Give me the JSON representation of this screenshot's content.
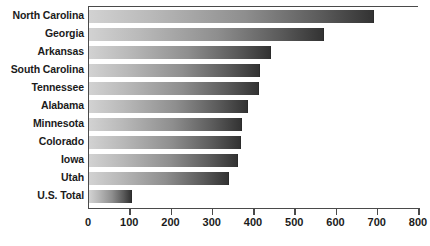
{
  "chart_data": {
    "type": "bar",
    "orientation": "horizontal",
    "title": "",
    "subtitle": "",
    "xlabel": "",
    "ylabel": "",
    "xlim": [
      0,
      800
    ],
    "xticks": [
      0,
      100,
      200,
      300,
      400,
      500,
      600,
      700,
      800
    ],
    "grid": false,
    "legend": false,
    "categories": [
      "North Carolina",
      "Georgia",
      "Arkansas",
      "South Carolina",
      "Tennessee",
      "Alabama",
      "Minnesota",
      "Colorado",
      "Iowa",
      "Utah",
      "U.S. Total"
    ],
    "values": [
      690,
      570,
      440,
      415,
      412,
      385,
      370,
      368,
      360,
      340,
      105
    ]
  },
  "colors": {
    "bar_gradient_start": "#d2d2d2",
    "bar_gradient_end": "#333333",
    "axis": "#4a4a4a",
    "text": "#1b1b1b",
    "background": "#ffffff"
  }
}
